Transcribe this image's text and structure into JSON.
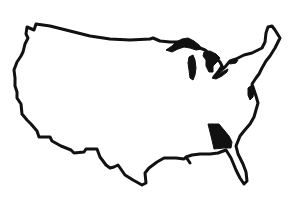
{
  "map": {
    "title": "United States outline map",
    "region": "Contiguous United States",
    "highlighted_state": "Georgia",
    "colors": {
      "background": "#ffffff",
      "outline": "#111111",
      "highlight_fill": "#111111",
      "lakes_fill": "#111111"
    },
    "features": [
      {
        "name": "us-outline",
        "type": "outline"
      },
      {
        "name": "great-lakes",
        "type": "water",
        "label": "Great Lakes"
      },
      {
        "name": "georgia",
        "type": "highlighted-state",
        "label": "Georgia"
      }
    ]
  }
}
